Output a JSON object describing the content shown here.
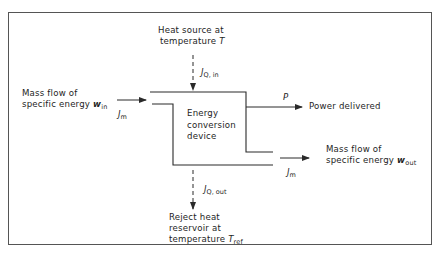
{
  "diagram": {
    "device": {
      "label_lines": [
        "Energy",
        "conversion",
        "device"
      ]
    },
    "heat_source": {
      "line1": "Heat source at",
      "line2_prefix": "temperature",
      "line2_symbol": "T",
      "flow_symbol": "J",
      "flow_sub": "Q, in"
    },
    "mass_in": {
      "line1": "Mass flow of",
      "line2_prefix": "specific energy",
      "line2_symbol": "w",
      "line2_sub": "in",
      "flow_symbol": "J",
      "flow_sub": "m"
    },
    "power": {
      "symbol": "P",
      "label": "Power delivered"
    },
    "mass_out": {
      "line1": "Mass flow of",
      "line2_prefix": "specific energy",
      "line2_symbol": "w",
      "line2_sub": "out",
      "flow_symbol": "J",
      "flow_sub": "m"
    },
    "reject_heat": {
      "flow_symbol": "J",
      "flow_sub": "Q, out",
      "line1": "Reject heat",
      "line2": "reservoir at",
      "line3_prefix": "temperature",
      "line3_symbol": "T",
      "line3_sub": "ref"
    },
    "colors": {
      "line": "#2a2a2a",
      "background": "#ffffff"
    }
  }
}
